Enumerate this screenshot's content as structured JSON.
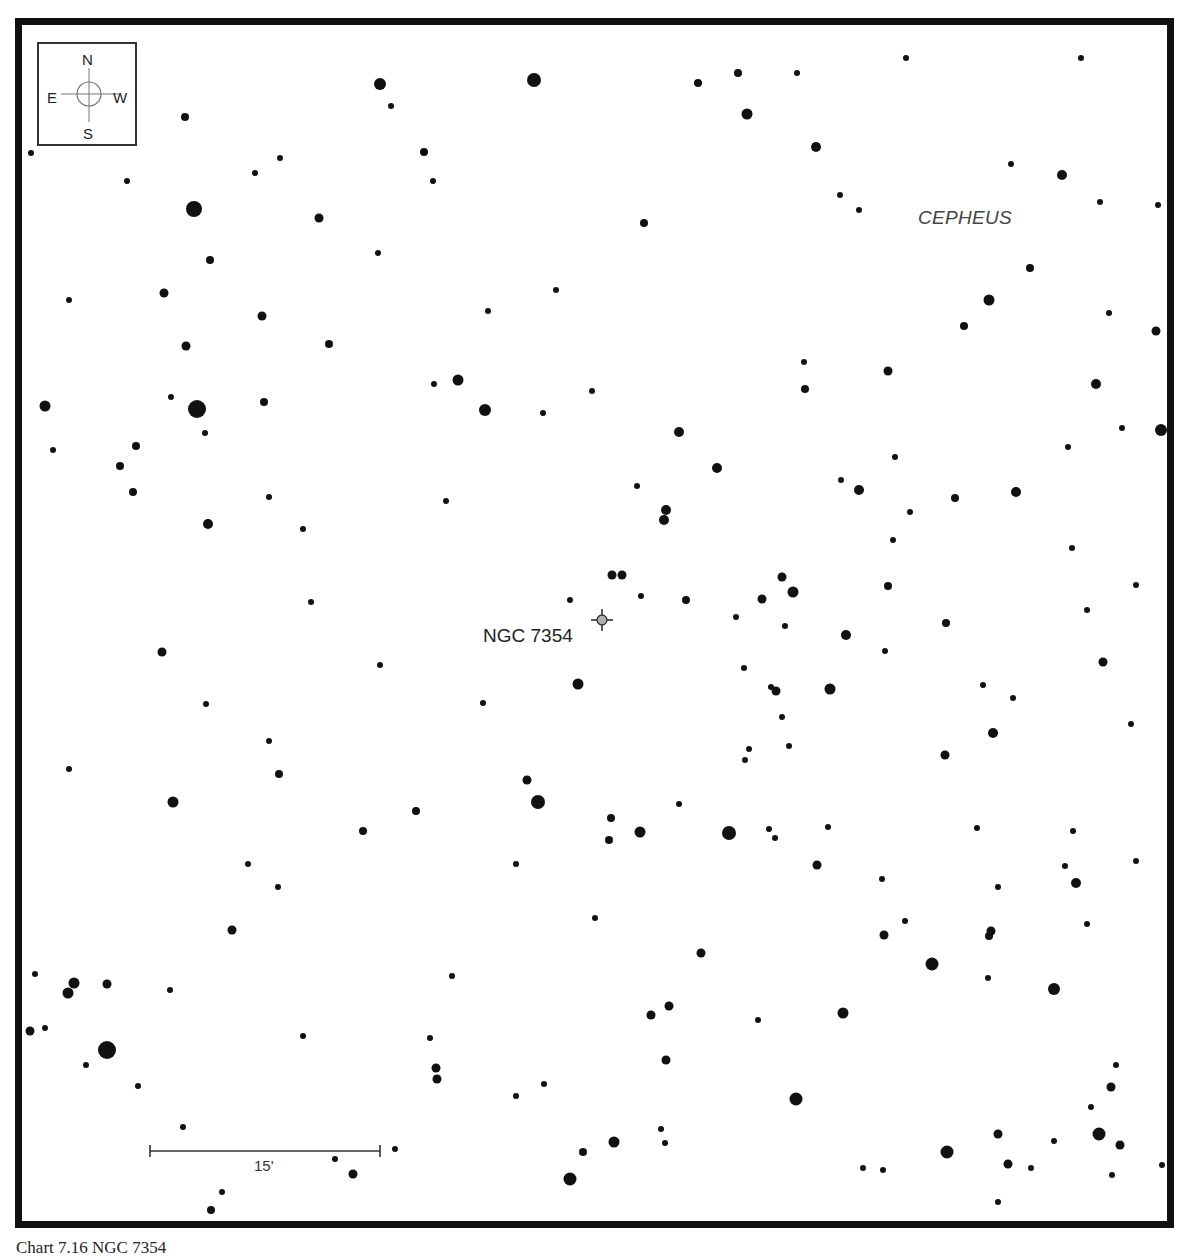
{
  "chart": {
    "constellation": "CEPHEUS",
    "object": {
      "name": "NGC 7354",
      "marker_color": "#b0b0b0",
      "x": 602,
      "y": 620
    },
    "compass": {
      "north": "N",
      "south": "S",
      "east": "E",
      "west": "W"
    },
    "scale": {
      "label": "15'"
    },
    "caption": "Chart 7.16 NGC 7354"
  },
  "stars": [
    [
      380,
      84,
      6
    ],
    [
      534,
      80,
      7
    ],
    [
      391,
      106,
      3
    ],
    [
      185,
      117,
      4
    ],
    [
      31,
      153,
      3
    ],
    [
      127,
      181,
      3
    ],
    [
      194,
      209,
      8
    ],
    [
      280,
      158,
      3
    ],
    [
      255,
      173,
      3
    ],
    [
      319,
      218,
      4.5
    ],
    [
      424,
      152,
      4
    ],
    [
      433,
      181,
      3
    ],
    [
      378,
      253,
      3
    ],
    [
      210,
      260,
      4
    ],
    [
      164,
      293,
      4.5
    ],
    [
      69,
      300,
      3
    ],
    [
      262,
      316,
      4.5
    ],
    [
      186,
      346,
      4.5
    ],
    [
      329,
      344,
      4
    ],
    [
      698,
      83,
      4
    ],
    [
      738,
      73,
      4
    ],
    [
      797,
      73,
      3
    ],
    [
      747,
      114,
      5.5
    ],
    [
      816,
      147,
      5
    ],
    [
      906,
      58,
      3
    ],
    [
      1081,
      58,
      3
    ],
    [
      840,
      195,
      3
    ],
    [
      859,
      210,
      3
    ],
    [
      1011,
      164,
      3
    ],
    [
      1062,
      175,
      5
    ],
    [
      1100,
      202,
      3
    ],
    [
      1158,
      205,
      3
    ],
    [
      644,
      223,
      4
    ],
    [
      556,
      290,
      3
    ],
    [
      488,
      311,
      3
    ],
    [
      1030,
      268,
      4
    ],
    [
      989,
      300,
      5.5
    ],
    [
      964,
      326,
      4
    ],
    [
      1109,
      313,
      3
    ],
    [
      1156,
      331,
      4.5
    ],
    [
      45,
      406,
      5.5
    ],
    [
      53,
      450,
      3
    ],
    [
      171,
      397,
      3
    ],
    [
      197,
      409,
      9
    ],
    [
      205,
      433,
      3
    ],
    [
      264,
      402,
      4
    ],
    [
      136,
      446,
      4
    ],
    [
      120,
      466,
      4
    ],
    [
      133,
      492,
      4
    ],
    [
      208,
      524,
      5
    ],
    [
      269,
      497,
      3
    ],
    [
      303,
      529,
      3
    ],
    [
      434,
      384,
      3
    ],
    [
      458,
      380,
      5.5
    ],
    [
      485,
      410,
      6
    ],
    [
      543,
      413,
      3
    ],
    [
      592,
      391,
      3
    ],
    [
      679,
      432,
      5
    ],
    [
      717,
      468,
      5
    ],
    [
      637,
      486,
      3
    ],
    [
      446,
      501,
      3
    ],
    [
      666,
      510,
      5
    ],
    [
      664,
      520,
      5
    ],
    [
      612,
      575,
      4.5
    ],
    [
      622,
      575,
      4.5
    ],
    [
      570,
      600,
      3
    ],
    [
      641,
      596,
      3
    ],
    [
      686,
      600,
      4
    ],
    [
      804,
      362,
      3
    ],
    [
      805,
      389,
      4
    ],
    [
      888,
      371,
      4.5
    ],
    [
      1096,
      384,
      5
    ],
    [
      1122,
      428,
      3
    ],
    [
      1161,
      430,
      6
    ],
    [
      841,
      480,
      3
    ],
    [
      859,
      490,
      5
    ],
    [
      895,
      457,
      3
    ],
    [
      955,
      498,
      4
    ],
    [
      1016,
      492,
      5
    ],
    [
      1068,
      447,
      3
    ],
    [
      910,
      512,
      3
    ],
    [
      782,
      577,
      4.5
    ],
    [
      762,
      599,
      4.5
    ],
    [
      793,
      592,
      5.5
    ],
    [
      893,
      540,
      3
    ],
    [
      888,
      586,
      4
    ],
    [
      736,
      617,
      3
    ],
    [
      785,
      626,
      3
    ],
    [
      846,
      635,
      5
    ],
    [
      885,
      651,
      3
    ],
    [
      946,
      623,
      4
    ],
    [
      1072,
      548,
      3
    ],
    [
      1136,
      585,
      3
    ],
    [
      1087,
      610,
      3
    ],
    [
      1103,
      662,
      4.5
    ],
    [
      162,
      652,
      4.5
    ],
    [
      311,
      602,
      3
    ],
    [
      380,
      665,
      3
    ],
    [
      206,
      704,
      3
    ],
    [
      269,
      741,
      3
    ],
    [
      279,
      774,
      4
    ],
    [
      69,
      769,
      3
    ],
    [
      173,
      802,
      5.5
    ],
    [
      248,
      864,
      3
    ],
    [
      278,
      887,
      3
    ],
    [
      232,
      930,
      4.5
    ],
    [
      363,
      831,
      4
    ],
    [
      416,
      811,
      4
    ],
    [
      578,
      684,
      5.5
    ],
    [
      483,
      703,
      3
    ],
    [
      744,
      668,
      3
    ],
    [
      771,
      687,
      3
    ],
    [
      776,
      691,
      4.5
    ],
    [
      782,
      717,
      3
    ],
    [
      749,
      749,
      3
    ],
    [
      745,
      760,
      3
    ],
    [
      789,
      746,
      3
    ],
    [
      527,
      780,
      4.5
    ],
    [
      538,
      802,
      7
    ],
    [
      611,
      818,
      4
    ],
    [
      609,
      840,
      4
    ],
    [
      640,
      832,
      5.5
    ],
    [
      679,
      804,
      3
    ],
    [
      729,
      833,
      7
    ],
    [
      769,
      829,
      3
    ],
    [
      775,
      838,
      3
    ],
    [
      516,
      864,
      3
    ],
    [
      595,
      918,
      3
    ],
    [
      830,
      689,
      5.5
    ],
    [
      983,
      685,
      3
    ],
    [
      1013,
      698,
      3
    ],
    [
      993,
      733,
      5
    ],
    [
      945,
      755,
      4.5
    ],
    [
      1131,
      724,
      3
    ],
    [
      828,
      827,
      3
    ],
    [
      977,
      828,
      3
    ],
    [
      1073,
      831,
      3
    ],
    [
      817,
      865,
      4.5
    ],
    [
      882,
      879,
      3
    ],
    [
      998,
      887,
      3
    ],
    [
      1065,
      866,
      3
    ],
    [
      1076,
      883,
      5
    ],
    [
      1136,
      861,
      3
    ],
    [
      905,
      921,
      3
    ],
    [
      884,
      935,
      4.5
    ],
    [
      991,
      931,
      4.5
    ],
    [
      989,
      936,
      4
    ],
    [
      1087,
      924,
      3
    ],
    [
      35,
      974,
      3
    ],
    [
      74,
      983,
      5.5
    ],
    [
      68,
      993,
      5.5
    ],
    [
      107,
      984,
      4.5
    ],
    [
      170,
      990,
      3
    ],
    [
      30,
      1031,
      4.5
    ],
    [
      45,
      1028,
      3
    ],
    [
      107,
      1050,
      9
    ],
    [
      86,
      1065,
      3
    ],
    [
      138,
      1086,
      3
    ],
    [
      183,
      1127,
      3
    ],
    [
      303,
      1036,
      3
    ],
    [
      395,
      1149,
      3
    ],
    [
      335,
      1159,
      3
    ],
    [
      353,
      1174,
      4.5
    ],
    [
      222,
      1192,
      3
    ],
    [
      211,
      1210,
      4
    ],
    [
      452,
      976,
      3
    ],
    [
      430,
      1038,
      3
    ],
    [
      436,
      1068,
      4.5
    ],
    [
      437,
      1079,
      4.5
    ],
    [
      516,
      1096,
      3
    ],
    [
      544,
      1084,
      3
    ],
    [
      651,
      1015,
      4.5
    ],
    [
      669,
      1006,
      4.5
    ],
    [
      758,
      1020,
      3
    ],
    [
      666,
      1060,
      4.5
    ],
    [
      701,
      953,
      4.5
    ],
    [
      843,
      1013,
      5.5
    ],
    [
      796,
      1099,
      6.5
    ],
    [
      583,
      1152,
      4
    ],
    [
      614,
      1142,
      5.5
    ],
    [
      570,
      1179,
      6.5
    ],
    [
      661,
      1129,
      3
    ],
    [
      665,
      1143,
      3
    ],
    [
      932,
      964,
      6.5
    ],
    [
      988,
      978,
      3
    ],
    [
      1054,
      989,
      6
    ],
    [
      1116,
      1065,
      3
    ],
    [
      1111,
      1087,
      4.5
    ],
    [
      1091,
      1107,
      3
    ],
    [
      998,
      1134,
      4.5
    ],
    [
      1054,
      1141,
      3
    ],
    [
      1099,
      1134,
      6.5
    ],
    [
      1120,
      1145,
      4.5
    ],
    [
      947,
      1152,
      6.5
    ],
    [
      1008,
      1164,
      4.5
    ],
    [
      1031,
      1168,
      3
    ],
    [
      863,
      1168,
      3
    ],
    [
      883,
      1170,
      3
    ],
    [
      998,
      1202,
      3
    ],
    [
      1112,
      1175,
      3
    ],
    [
      1162,
      1165,
      3
    ]
  ]
}
